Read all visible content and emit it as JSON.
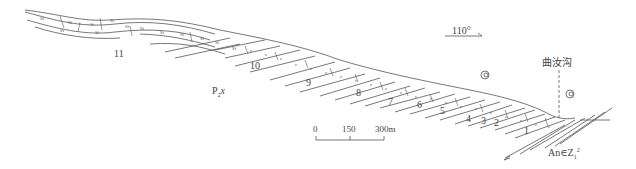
{
  "diagram": {
    "type": "geological-cross-section",
    "orientation": {
      "label": "110°",
      "arrow": "east-southeast"
    },
    "place_name": "曲汝沟",
    "formation_label": {
      "main": "P",
      "sub": "2",
      "suffix": "x"
    },
    "basement_label": {
      "main": "An∈Z",
      "sub": "1",
      "sup": "2"
    },
    "layer_labels": [
      "1",
      "2",
      "3",
      "4",
      "5",
      "6",
      "7",
      "8",
      "9",
      "10",
      "11"
    ],
    "scale_bar": {
      "ticks": [
        "0",
        "150",
        "300m"
      ],
      "unit": "m"
    },
    "lithology_symbols": [
      "Si (siliceous)",
      "c (limestone)",
      "fossil spiral (gastropod)"
    ]
  },
  "colors": {
    "line": "#555555",
    "text": "#444444",
    "background": "#ffffff"
  }
}
